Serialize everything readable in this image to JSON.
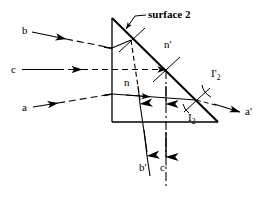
{
  "figure": {
    "title": "surface 2",
    "type": "optical-ray-diagram"
  },
  "annotations": {
    "surface_label": "surface 2",
    "medium_inside": "n",
    "medium_outside": "n'",
    "angle_internal": "I",
    "angle_internal_sub": "2",
    "angle_external": "I'",
    "angle_external_sub": "2"
  },
  "rays": {
    "incident": [
      {
        "id": "ray-b",
        "label": "b",
        "x": 22,
        "y": 30
      },
      {
        "id": "ray-c",
        "label": "c",
        "x": 11,
        "y": 69
      },
      {
        "id": "ray-a",
        "label": "a",
        "x": 22,
        "y": 107
      }
    ],
    "emergent": [
      {
        "id": "ray-a-prime",
        "label": "a'",
        "x": 245,
        "y": 111
      },
      {
        "id": "ray-b-prime",
        "label": "b'",
        "x": 139,
        "y": 167
      },
      {
        "id": "ray-c-prime",
        "label": "c'",
        "x": 160,
        "y": 167
      }
    ]
  },
  "colors": {
    "stroke": "#000000",
    "background": "#ffffff"
  },
  "geometry": {
    "prism_apex": [
      112,
      18
    ],
    "prism_base_left": [
      112,
      122
    ],
    "prism_base_right": [
      218,
      122
    ]
  }
}
